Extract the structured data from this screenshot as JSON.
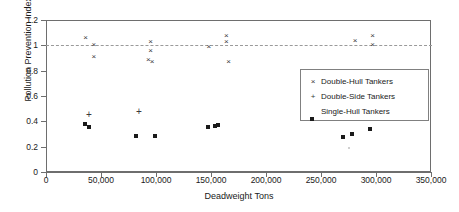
{
  "chart_data": {
    "type": "scatter",
    "title": "",
    "xlabel": "Deadweight Tons",
    "ylabel": "Pollution Prevention Index E",
    "xlim": [
      0,
      350000
    ],
    "ylim": [
      0,
      1.2
    ],
    "xticks": [
      0,
      50000,
      100000,
      150000,
      200000,
      250000,
      300000,
      350000
    ],
    "xticklabels": [
      "0",
      "50,000",
      "100,000",
      "150,000",
      "200,000",
      "250,000",
      "300,000",
      "350,000"
    ],
    "yticks": [
      0,
      0.2,
      0.4,
      0.6,
      0.8,
      1,
      1.2
    ],
    "yticklabels": [
      "0",
      "0.2",
      "0.4",
      "0.6",
      "0.8",
      "1",
      "1.2"
    ],
    "grid": false,
    "legend_position": "center-right",
    "reference_lines": [
      {
        "axis": "y",
        "value": 1.0,
        "style": "dashed",
        "color": "#9a9a9a"
      }
    ],
    "series": [
      {
        "name": "Double-Hull Tankers",
        "marker": "x",
        "color": "#3a3a3a",
        "points": [
          {
            "x": 36000,
            "y": 1.055
          },
          {
            "x": 43500,
            "y": 1.005
          },
          {
            "x": 43500,
            "y": 0.91
          },
          {
            "x": 95000,
            "y": 1.025
          },
          {
            "x": 95000,
            "y": 0.955
          },
          {
            "x": 93000,
            "y": 0.885
          },
          {
            "x": 96500,
            "y": 0.865
          },
          {
            "x": 148000,
            "y": 0.985
          },
          {
            "x": 164000,
            "y": 1.075
          },
          {
            "x": 164000,
            "y": 1.03
          },
          {
            "x": 166000,
            "y": 0.87
          },
          {
            "x": 281000,
            "y": 1.035
          },
          {
            "x": 297000,
            "y": 1.07
          },
          {
            "x": 297000,
            "y": 1.0
          }
        ]
      },
      {
        "name": "Double-Side Tankers",
        "marker": "+",
        "color": "#3a3a3a",
        "points": [
          {
            "x": 39000,
            "y": 0.45
          },
          {
            "x": 84500,
            "y": 0.47
          }
        ]
      },
      {
        "name": "Single-Hull Tankers",
        "marker": "square",
        "color": "#1a1a1a",
        "points": [
          {
            "x": 35500,
            "y": 0.38
          },
          {
            "x": 39000,
            "y": 0.355
          },
          {
            "x": 81500,
            "y": 0.285
          },
          {
            "x": 99000,
            "y": 0.285
          },
          {
            "x": 147000,
            "y": 0.355
          },
          {
            "x": 153500,
            "y": 0.363
          },
          {
            "x": 156000,
            "y": 0.371
          },
          {
            "x": 270000,
            "y": 0.276
          },
          {
            "x": 278000,
            "y": 0.3
          },
          {
            "x": 294500,
            "y": 0.34
          },
          {
            "x": 275000,
            "y": 0.19
          }
        ]
      }
    ]
  },
  "legend": {
    "entries": [
      {
        "symbol": "×",
        "label": "Double-Hull Tankers"
      },
      {
        "symbol": "+",
        "label": "Double-Side Tankers"
      },
      {
        "symbol": "",
        "label": "Single-Hull Tankers"
      }
    ]
  }
}
